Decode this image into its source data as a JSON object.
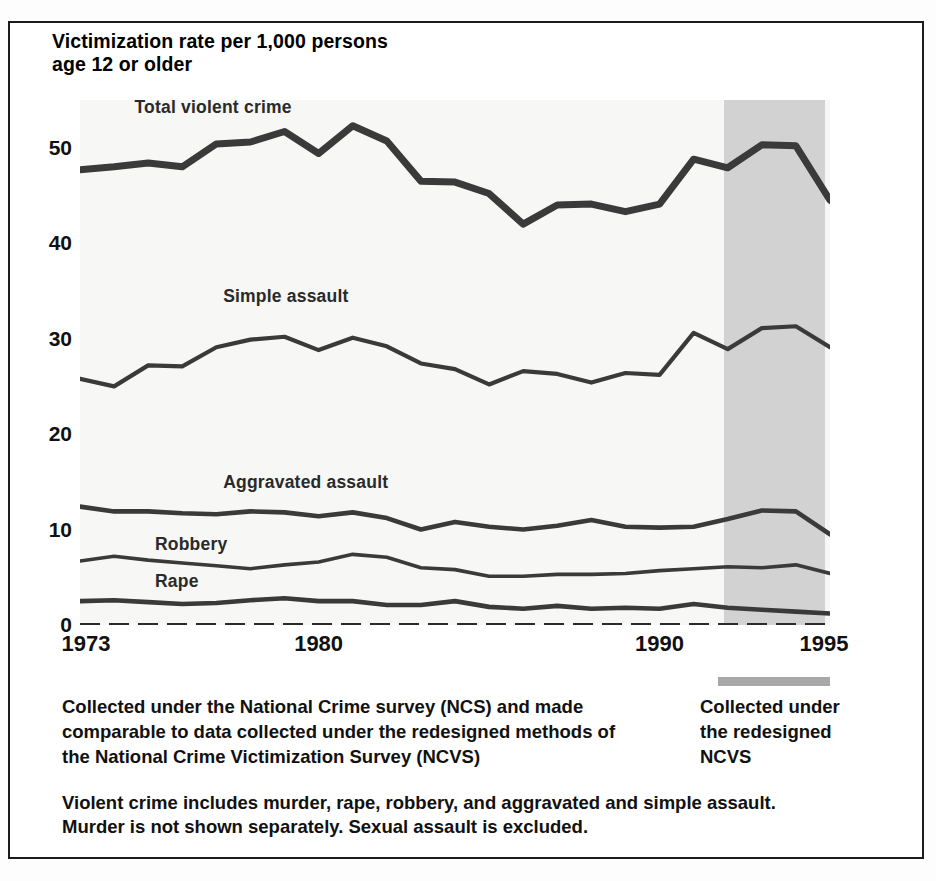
{
  "figure": {
    "y_axis_caption_line1": "Victimization rate per 1,000 persons",
    "y_axis_caption_line2": "age 12 or older",
    "ncvs_marker_name": "redesigned-ncvs-period-bar"
  },
  "notes": {
    "left": [
      "Collected under the National Crime survey (NCS) and made",
      "comparable to data collected under the redesigned methods of",
      "the National Crime Victimization Survey (NCVS)"
    ],
    "right": [
      "Collected under",
      "the redesigned",
      "NCVS"
    ],
    "bottom": [
      "Violent crime includes murder, rape, robbery, and aggravated and simple assault.",
      "Murder is not shown separately. Sexual assault is excluded."
    ]
  },
  "colors": {
    "line": "#3a3a3a",
    "plot_background": "#f7f7f5",
    "shaded_band": "#d2d2d2",
    "frame": "#1b1b1b",
    "marker_bar": "#a8a8a8"
  },
  "chart_data": {
    "type": "line",
    "title": "",
    "subtitle": "",
    "xlabel": "",
    "ylabel": "Victimization rate per 1,000 persons age 12 or older",
    "xlim": [
      1973,
      1995
    ],
    "ylim": [
      0,
      55
    ],
    "yticks": [
      0,
      10,
      20,
      30,
      40,
      50
    ],
    "xticks": [
      1973,
      1980,
      1990,
      1995
    ],
    "xtick_labels": [
      "1973",
      "1980",
      "1990",
      "1995"
    ],
    "grid": false,
    "legend": "inline-series-labels",
    "x": [
      1973,
      1974,
      1975,
      1976,
      1977,
      1978,
      1979,
      1980,
      1981,
      1982,
      1983,
      1984,
      1985,
      1986,
      1987,
      1988,
      1989,
      1990,
      1991,
      1992,
      1993,
      1994,
      1995
    ],
    "series": [
      {
        "name": "Total violent crime",
        "label_position": "top-left",
        "values": [
          47.7,
          48.0,
          48.4,
          48.0,
          50.4,
          50.6,
          51.7,
          49.4,
          52.3,
          50.7,
          46.5,
          46.4,
          45.2,
          42.0,
          44.0,
          44.1,
          43.3,
          44.1,
          48.8,
          47.9,
          50.3,
          50.2,
          44.5
        ]
      },
      {
        "name": "Simple assault",
        "label_position": "upper-middle",
        "values": [
          25.8,
          25.0,
          27.2,
          27.1,
          29.1,
          29.9,
          30.2,
          28.8,
          30.1,
          29.2,
          27.4,
          26.8,
          25.2,
          26.6,
          26.3,
          25.4,
          26.4,
          26.2,
          30.6,
          28.9,
          31.1,
          31.3,
          29.1
        ]
      },
      {
        "name": "Aggravated assault",
        "label_position": "lower-left",
        "values": [
          12.4,
          11.9,
          11.9,
          11.7,
          11.6,
          11.9,
          11.8,
          11.4,
          11.8,
          11.2,
          10.0,
          10.8,
          10.3,
          10.0,
          10.4,
          11.0,
          10.3,
          10.2,
          10.3,
          11.1,
          12.0,
          11.9,
          9.5
        ]
      },
      {
        "name": "Robbery",
        "label_position": "lower-left",
        "values": [
          6.7,
          7.2,
          6.8,
          6.5,
          6.2,
          5.9,
          6.3,
          6.6,
          7.4,
          7.1,
          6.0,
          5.8,
          5.1,
          5.1,
          5.3,
          5.3,
          5.4,
          5.7,
          5.9,
          6.1,
          6.0,
          6.3,
          5.4
        ]
      },
      {
        "name": "Rape",
        "label_position": "lower-left",
        "values": [
          2.5,
          2.6,
          2.4,
          2.2,
          2.3,
          2.6,
          2.8,
          2.5,
          2.5,
          2.1,
          2.1,
          2.5,
          1.9,
          1.7,
          2.0,
          1.7,
          1.8,
          1.7,
          2.2,
          1.8,
          1.6,
          1.4,
          1.2
        ]
      }
    ],
    "annotations": [
      {
        "name": "redesign-band",
        "x_start": 1991.9,
        "x_end": 1994.85,
        "meaning": "Collected under the redesigned NCVS"
      }
    ]
  }
}
